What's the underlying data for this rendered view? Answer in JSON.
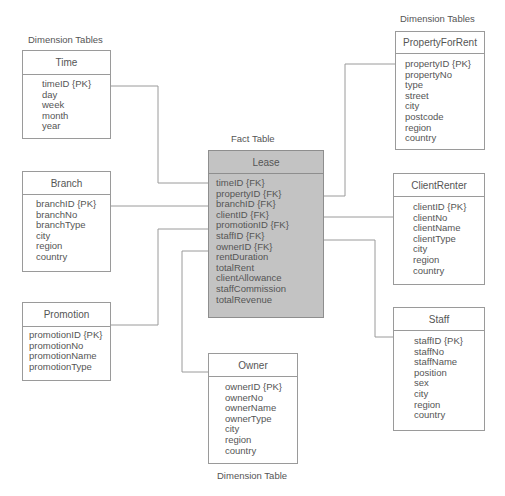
{
  "captions": {
    "left_dimension": "Dimension Tables",
    "right_dimension": "Dimension Tables",
    "fact": "Fact Table",
    "bottom_dimension": "Dimension Table"
  },
  "colors": {
    "fact_fill": "#c3c3c3",
    "dimension_fill": "#ffffff",
    "line": "#9a9a9a",
    "text": "#555555"
  },
  "fact_table": {
    "name": "Lease",
    "attributes": [
      "timeID {FK}",
      "propertyID {FK}",
      "branchID {FK}",
      "clientID {FK}",
      "promotionID {FK}",
      "staffID {FK}",
      "ownerID {FK}",
      "rentDuration",
      "totalRent",
      "clientAllowance",
      "staffCommission",
      "totalRevenue"
    ]
  },
  "dimensions": {
    "time": {
      "name": "Time",
      "attributes": [
        "timeID {PK}",
        "day",
        "week",
        "month",
        "year"
      ]
    },
    "branch": {
      "name": "Branch",
      "attributes": [
        "branchID {PK}",
        "branchNo",
        "branchType",
        "city",
        "region",
        "country"
      ]
    },
    "promotion": {
      "name": "Promotion",
      "attributes": [
        "promotionID {PK}",
        "promotionNo",
        "promotionName",
        "promotionType"
      ]
    },
    "property": {
      "name": "PropertyForRent",
      "attributes": [
        "propertyID {PK}",
        "propertyNo",
        "type",
        "street",
        "city",
        "postcode",
        "region",
        "country"
      ]
    },
    "client": {
      "name": "ClientRenter",
      "attributes": [
        "clientID {PK}",
        "clientNo",
        "clientName",
        "clientType",
        "city",
        "region",
        "country"
      ]
    },
    "staff": {
      "name": "Staff",
      "attributes": [
        "staffID {PK}",
        "staffNo",
        "staffName",
        "position",
        "sex",
        "city",
        "region",
        "country"
      ]
    },
    "owner": {
      "name": "Owner",
      "attributes": [
        "ownerID {PK}",
        "ownerNo",
        "ownerName",
        "ownerType",
        "city",
        "region",
        "country"
      ]
    }
  },
  "relationships": [
    {
      "from": "Time.timeID",
      "to": "Lease.timeID"
    },
    {
      "from": "Branch.branchID",
      "to": "Lease.branchID"
    },
    {
      "from": "Promotion.promotionID",
      "to": "Lease.promotionID"
    },
    {
      "from": "Owner.ownerID",
      "to": "Lease.ownerID"
    },
    {
      "from": "PropertyForRent.propertyID",
      "to": "Lease.propertyID"
    },
    {
      "from": "ClientRenter.clientID",
      "to": "Lease.clientID"
    },
    {
      "from": "Staff.staffID",
      "to": "Lease.staffID"
    }
  ]
}
